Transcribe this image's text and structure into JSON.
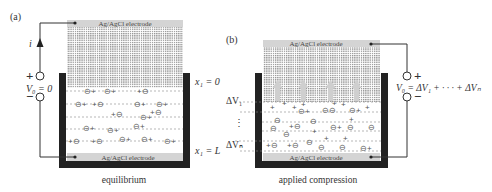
{
  "figure": {
    "panels": [
      {
        "id": "a",
        "label": "(a)",
        "caption": "equilibrium",
        "top_electrode_label": "Ag/AgCl electrode",
        "bottom_electrode_label": "Ag/AgCl electrode",
        "current_label": "i",
        "terminal_plus": "+",
        "terminal_minus": "−",
        "voltage_label": "V₀ = 0",
        "position_top": "x₁ = 0",
        "position_bottom": "x₁ = L"
      },
      {
        "id": "b",
        "label": "(b)",
        "caption": "applied compression",
        "top_electrode_label": "Ag/AgCl electrode",
        "bottom_electrode_label": "Ag/AgCl electrode",
        "terminal_plus": "+",
        "terminal_minus": "−",
        "voltage_label": "V₀ = ΔV₁ + · · · + ΔVₙ",
        "delta_top": "ΔV₁",
        "delta_bottom": "ΔVₙ",
        "delta_ellipsis": "⋮"
      }
    ],
    "ion_symbols": {
      "cation": "+",
      "anion": "⊖"
    },
    "colors": {
      "container": "#222222",
      "electrode": "#d4d4d4",
      "mesh": "#9a9a9a",
      "wire": "#333333",
      "arrow": "#c8c8c8",
      "text": "#333333"
    }
  }
}
